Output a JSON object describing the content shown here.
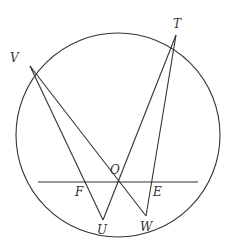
{
  "diagram": {
    "type": "geometry-circle",
    "stroke_color": "#333333",
    "circle": {
      "cx": 118,
      "cy": 135,
      "r": 102
    },
    "points": {
      "V": {
        "x": 30,
        "y": 66,
        "label": "V",
        "lx": 10,
        "ly": 62
      },
      "T": {
        "x": 176,
        "y": 35,
        "label": "T",
        "lx": 173,
        "ly": 28
      },
      "O": {
        "x": 119,
        "y": 182,
        "label": "O",
        "lx": 110,
        "ly": 174
      },
      "F": {
        "label": "F",
        "lx": 75,
        "ly": 196
      },
      "E": {
        "label": "E",
        "lx": 153,
        "ly": 196
      },
      "U": {
        "x": 103,
        "y": 220,
        "label": "U",
        "lx": 97,
        "ly": 234
      },
      "W": {
        "x": 146,
        "y": 216,
        "label": "W",
        "lx": 140,
        "ly": 231
      }
    },
    "segments": [
      {
        "name": "VU",
        "x1": 30,
        "y1": 66,
        "x2": 103,
        "y2": 220
      },
      {
        "name": "VW",
        "x1": 30,
        "y1": 66,
        "x2": 146,
        "y2": 216
      },
      {
        "name": "TU",
        "x1": 176,
        "y1": 35,
        "x2": 103,
        "y2": 220
      },
      {
        "name": "TW",
        "x1": 176,
        "y1": 35,
        "x2": 146,
        "y2": 216
      },
      {
        "name": "chord",
        "x1": 38,
        "y1": 182,
        "x2": 198,
        "y2": 182
      }
    ]
  }
}
